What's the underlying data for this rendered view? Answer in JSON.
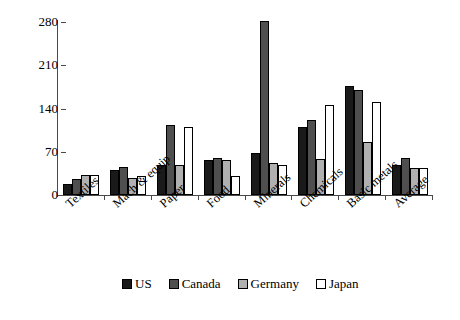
{
  "chart_data": {
    "type": "bar",
    "title": "",
    "subtitle": "",
    "xlabel": "",
    "ylabel": "",
    "ylim": [
      0,
      280
    ],
    "yticks": [
      0,
      70,
      140,
      210,
      280
    ],
    "grid": false,
    "legend_position": "bottom",
    "categories": [
      "Textiles",
      "Mach & equip",
      "Paper",
      "Food",
      "Minerals",
      "Chemicals",
      "Basic metals",
      "Average"
    ],
    "series": [
      {
        "name": "US",
        "color": "#1a1a1a",
        "border": "#000000",
        "values": [
          18,
          40,
          48,
          57,
          68,
          110,
          176,
          48
        ]
      },
      {
        "name": "Canada",
        "color": "#4f4f4f",
        "border": "#000000",
        "values": [
          26,
          45,
          113,
          60,
          281,
          122,
          170,
          60
        ]
      },
      {
        "name": "Germany",
        "color": "#b0b0b0",
        "border": "#000000",
        "values": [
          33,
          28,
          48,
          57,
          52,
          58,
          85,
          43
        ]
      },
      {
        "name": "Japan",
        "color": "#ffffff",
        "border": "#000000",
        "values": [
          33,
          30,
          110,
          30,
          48,
          145,
          150,
          43
        ]
      }
    ]
  },
  "legend": {
    "entries": [
      {
        "label": "US"
      },
      {
        "label": "Canada"
      },
      {
        "label": "Germany"
      },
      {
        "label": "Japan"
      }
    ]
  }
}
